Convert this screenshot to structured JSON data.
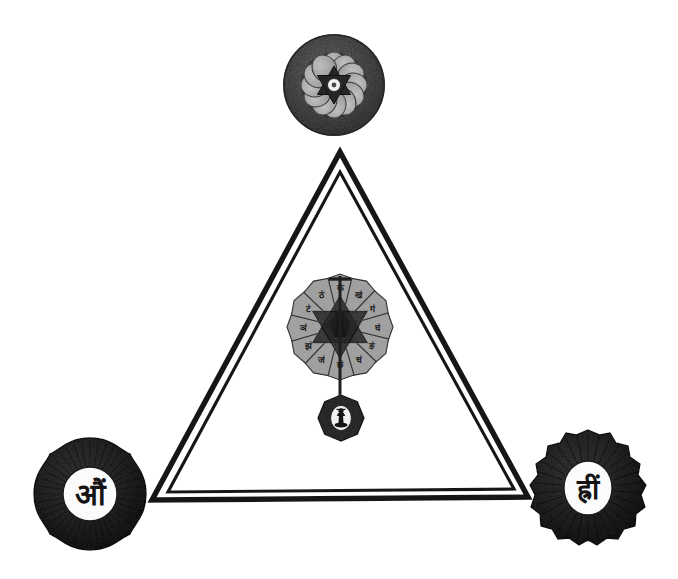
{
  "figure": {
    "width": 678,
    "height": 579,
    "background_color": "#ffffff",
    "ink_color": "#1a1a1a"
  },
  "palette": {
    "ink_black": "#1a1a1a",
    "dark_gray": "#3c3c3c",
    "mid_gray": "#5e5e5e",
    "petal_gray": "#9a9a9a",
    "light_petal": "#b8b8b8",
    "paper_white": "#ffffff",
    "soft_white": "#f2f2f2"
  },
  "triangle": {
    "name": "double-outline-equilateral-triangle",
    "stroke_color": "#1a1a1a",
    "outer_stroke_width": 5,
    "inner_stroke_width": 3,
    "gap_color": "#ffffff",
    "vertices": {
      "apex": {
        "x": 340,
        "y": 152
      },
      "bottom_left": {
        "x": 152,
        "y": 500
      },
      "bottom_right": {
        "x": 528,
        "y": 497
      }
    }
  },
  "chakras": [
    {
      "id": "apex-chakra",
      "position_label": "top vertex",
      "center": {
        "x": 334,
        "y": 85
      },
      "outer_radius": 51,
      "inner_radius": 31,
      "petal_count": 12,
      "ring_color": "#4a4a4a",
      "petal_color": "#b5b5b5",
      "star_color": "#2a2a2a",
      "center_color": "#f5f5f5",
      "has_hexagram": true,
      "bija": "",
      "description": "twelve-petalled lotus enclosing a six-pointed star with a pale seed at the hub"
    },
    {
      "id": "lower-left-chakra",
      "position_label": "bottom-left vertex",
      "center": {
        "x": 90,
        "y": 494
      },
      "outer_radius": 56,
      "disc_radius": 27,
      "lobe_count": 4,
      "ray_count": 64,
      "ring_color": "#272727",
      "disc_color": "#fbfbfb",
      "bija": "औं",
      "bija_color": "#141414",
      "description": "four-lobed radiant mandala with the seed syllable inscribed in a white disc"
    },
    {
      "id": "lower-right-chakra",
      "position_label": "bottom-right vertex",
      "center": {
        "x": 588,
        "y": 488
      },
      "outer_radius": 58,
      "disc_radius": 26,
      "scallop_count": 28,
      "ring_color": "#222222",
      "disc_color": "#fbfbfb",
      "bija": "ह्रीं",
      "bija_color": "#141414",
      "description": "scalloped dark mandala with the seed syllable inscribed in a white oval"
    },
    {
      "id": "central-chakra",
      "position_label": "interior of triangle",
      "center": {
        "x": 340,
        "y": 327
      },
      "outer_radius": 52,
      "petal_count": 12,
      "petal_color": "#a8a8a8",
      "petal_edge_color": "#3a3a3a",
      "star_color": "#2e2e2e",
      "has_hexagram": true,
      "bija": "",
      "description": "twelve-petalled lotus, each petal bearing a seed syllable, centred on a shatkona star"
    }
  ],
  "central_petal_syllables": [
    "कं",
    "खं",
    "गं",
    "घं",
    "ङं",
    "चं",
    "छं",
    "जं",
    "झं",
    "ञं",
    "टं",
    "ठं"
  ],
  "pendant": {
    "id": "lingam-pendant",
    "center": {
      "x": 341,
      "y": 418
    },
    "outer_radius": 23,
    "lobe_count": 8,
    "ring_color": "#303030",
    "disc_color": "#f0f0f0",
    "symbol_name": "shiva-lingam",
    "symbol_color": "#141414",
    "description": "eight-lobed rosette containing a lingam emblem, suspended beneath the central lotus"
  },
  "connector": {
    "id": "central-axis-stem",
    "color": "#1f1f1f",
    "top": {
      "x": 340,
      "y": 276
    },
    "bottom": {
      "x": 340,
      "y": 398
    },
    "width": 3,
    "description": "vertical axis running through the central lotus down to the pendant"
  },
  "labels": {
    "apex_chakra": "apex chakra",
    "left_chakra": "left chakra",
    "right_chakra": "right chakra",
    "central_chakra": "central lotus",
    "pendant": "lingam pendant",
    "triangle": "yantra triangle"
  }
}
